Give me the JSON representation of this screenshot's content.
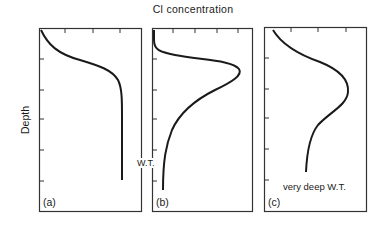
{
  "figure": {
    "title": "Cl concentration",
    "y_axis_label": "Depth",
    "panels": [
      {
        "id": "a",
        "label": "(a)",
        "annotation": "W.T.",
        "description": "Concentration increases with depth then levels off to constant value"
      },
      {
        "id": "b",
        "label": "(b)",
        "annotation": "",
        "description": "Sharp peak at shallow depth then decreases to low values at depth"
      },
      {
        "id": "c",
        "label": "(c)",
        "annotation": "very deep W.T.",
        "description": "Broad peak then gradual decrease with depth"
      }
    ],
    "shared_annotation": "W.T.",
    "colors": {
      "line": "#1a1a1a",
      "frame": "#333333",
      "background": "#ffffff"
    }
  }
}
